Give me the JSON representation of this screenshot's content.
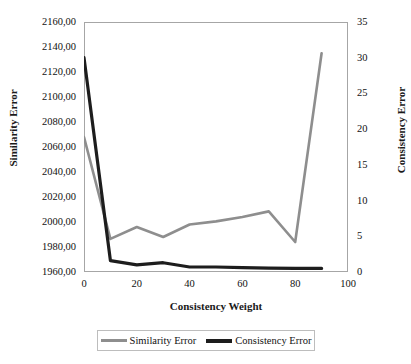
{
  "chart_data": {
    "type": "line",
    "title": "",
    "xlabel": "Consistency Weight",
    "ylabel": "Similarity Error",
    "y2label": "Consistency Error",
    "grid": false,
    "legend_position": "bottom",
    "xlim": [
      0,
      100
    ],
    "xticks": [
      "0",
      "20",
      "40",
      "60",
      "80",
      "100"
    ],
    "ylim": [
      1960,
      2160
    ],
    "yticks": [
      "1960,00",
      "1980,00",
      "2000,00",
      "2020,00",
      "2040,00",
      "2060,00",
      "2080,00",
      "2100,00",
      "2120,00",
      "2140,00",
      "2160,00"
    ],
    "y2lim": [
      0,
      35
    ],
    "y2ticks": [
      "0",
      "5",
      "10",
      "15",
      "20",
      "25",
      "30",
      "35"
    ],
    "x": [
      0,
      10,
      20,
      30,
      40,
      50,
      60,
      70,
      80,
      90
    ],
    "series": [
      {
        "name": "Similarity Error",
        "axis": "left",
        "color": "#8e8e8e",
        "values": [
          2068.0,
          1986.5,
          1996.0,
          1988.0,
          1998.0,
          2000.5,
          2004.0,
          2008.5,
          1984.0,
          2135.0
        ]
      },
      {
        "name": "Consistency Error",
        "axis": "right",
        "color": "#1d1d1d",
        "values": [
          30.0,
          1.6,
          1.0,
          1.3,
          0.7,
          0.7,
          0.6,
          0.55,
          0.5,
          0.5
        ]
      }
    ],
    "legend": [
      "Similarity Error",
      "Consistency Error"
    ],
    "colors": {
      "similarity_error": "#8e8e8e",
      "consistency_error": "#1d1d1d",
      "axis": "#a6a6a6",
      "background": "#ffffff"
    }
  }
}
